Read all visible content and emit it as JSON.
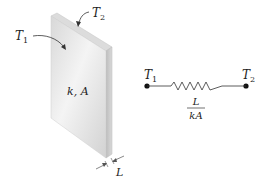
{
  "slab": {
    "property_label": "k, A",
    "left_temp": {
      "symbol": "T",
      "subscript": "1"
    },
    "right_temp": {
      "symbol": "T",
      "subscript": "2"
    },
    "thickness_label": "L"
  },
  "circuit": {
    "left_node": {
      "symbol": "T",
      "subscript": "1"
    },
    "right_node": {
      "symbol": "T",
      "subscript": "2"
    },
    "resistance_numerator": "L",
    "resistance_denominator": "kA"
  },
  "colors": {
    "slab_face": "#e6e6e6",
    "slab_side": "#c8c8c8",
    "slab_top": "#d6d6d6",
    "line": "#333333",
    "node": "#111111"
  }
}
